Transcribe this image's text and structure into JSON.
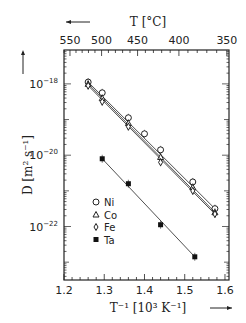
{
  "chart_data": {
    "type": "scatter",
    "title": "",
    "xlabel": "T^-1 [10^3 K^-1]",
    "ylabel": "D [m^2 s^-1]",
    "top_axis_label": "T [°C]",
    "xlim": [
      1.2,
      1.61
    ],
    "ylim_log10": [
      -23.5,
      -17.05
    ],
    "x_ticks": [
      1.2,
      1.3,
      1.4,
      1.5,
      1.6
    ],
    "x_tick_labels": [
      "1.2",
      "1.3",
      "1.4",
      "1.5",
      "1.6"
    ],
    "y_ticks_log10": [
      -18,
      -20,
      -22
    ],
    "y_tick_labels": [
      "10^-18",
      "10^-20",
      "10^-22"
    ],
    "top_ticks_C": [
      550,
      500,
      450,
      400,
      350
    ],
    "top_tick_labels": [
      "550",
      "500",
      "450",
      "400",
      "350"
    ],
    "grid": false,
    "legend_position": "lower-left inside",
    "series": [
      {
        "name": "Ni",
        "marker": "open-circle",
        "x": [
          1.26,
          1.295,
          1.36,
          1.4,
          1.44,
          1.52,
          1.575
        ],
        "log10_D": [
          -17.95,
          -18.25,
          -18.95,
          -19.4,
          -19.85,
          -20.75,
          -21.5
        ]
      },
      {
        "name": "Co",
        "marker": "open-triangle",
        "x": [
          1.26,
          1.295,
          1.36,
          1.44,
          1.52,
          1.575
        ],
        "log10_D": [
          -18.0,
          -18.4,
          -19.1,
          -20.05,
          -20.9,
          -21.6
        ]
      },
      {
        "name": "Fe",
        "marker": "open-diamond",
        "x": [
          1.26,
          1.295,
          1.36,
          1.44,
          1.52,
          1.575
        ],
        "log10_D": [
          -18.05,
          -18.5,
          -19.2,
          -20.2,
          -21.0,
          -21.65
        ]
      },
      {
        "name": "Ta",
        "marker": "filled-square",
        "x": [
          1.295,
          1.36,
          1.44,
          1.525
        ],
        "log10_D": [
          -20.1,
          -20.8,
          -21.95,
          -22.85
        ]
      }
    ]
  }
}
